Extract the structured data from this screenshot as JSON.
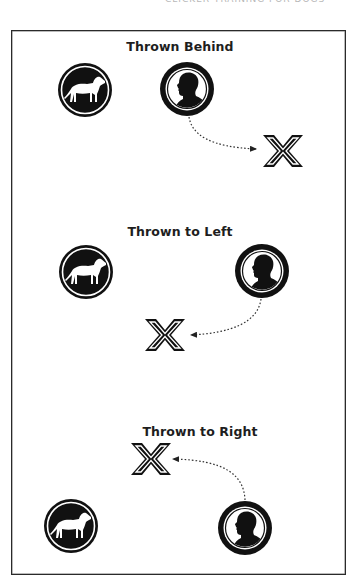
{
  "header": {
    "cutoff_text": "CLICKER TRAINING FOR DOGS"
  },
  "sections": [
    {
      "title": "Thrown Behind",
      "dog": {
        "icon": "dog-icon",
        "cx": 85,
        "cy": 90
      },
      "person": {
        "icon": "person-icon",
        "cx": 187,
        "cy": 89
      },
      "target": {
        "icon": "x-mark-icon",
        "cx": 283,
        "cy": 151
      },
      "arrow": {
        "from": "person",
        "to": "target",
        "style": "dotted"
      }
    },
    {
      "title": "Thrown to Left",
      "dog": {
        "icon": "dog-icon",
        "cx": 86,
        "cy": 272
      },
      "person": {
        "icon": "person-icon",
        "cx": 262,
        "cy": 271
      },
      "target": {
        "icon": "x-mark-icon",
        "cx": 165,
        "cy": 335
      },
      "arrow": {
        "from": "person",
        "to": "target",
        "style": "dotted"
      }
    },
    {
      "title": "Thrown to Right",
      "dog": {
        "icon": "dog-icon",
        "cx": 71,
        "cy": 526
      },
      "person": {
        "icon": "person-icon",
        "cx": 245,
        "cy": 528
      },
      "target": {
        "icon": "x-mark-icon",
        "cx": 151,
        "cy": 459
      },
      "arrow": {
        "from": "person",
        "to": "target",
        "style": "dotted"
      }
    }
  ],
  "colors": {
    "ink": "#111111",
    "frame": "#2a2a2a",
    "background": "#ffffff",
    "title": "#1e1e1e"
  }
}
